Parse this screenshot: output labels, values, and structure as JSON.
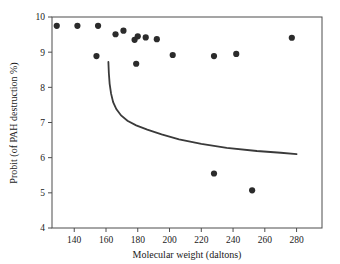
{
  "chart_data": {
    "type": "scatter",
    "title": "",
    "xlabel": "Molecular weight (daltons)",
    "ylabel": "Probit (of PAH destruction %)",
    "xlim": [
      126,
      296
    ],
    "ylim": [
      4,
      10
    ],
    "xticks": [
      140,
      160,
      180,
      200,
      220,
      240,
      260,
      280
    ],
    "yticks": [
      4,
      5,
      6,
      7,
      8,
      9,
      10
    ],
    "grid": false,
    "legend": null,
    "series": [
      {
        "name": "PAH destruction observations",
        "type": "scatter",
        "marker": "filled-circle",
        "color": "#2b2b2b",
        "points": [
          {
            "x": 129,
            "y": 9.75
          },
          {
            "x": 142,
            "y": 9.75
          },
          {
            "x": 155,
            "y": 9.75
          },
          {
            "x": 154,
            "y": 8.89
          },
          {
            "x": 166,
            "y": 9.51
          },
          {
            "x": 171,
            "y": 9.61
          },
          {
            "x": 178,
            "y": 9.35
          },
          {
            "x": 180,
            "y": 9.45
          },
          {
            "x": 179,
            "y": 8.67
          },
          {
            "x": 185,
            "y": 9.42
          },
          {
            "x": 192,
            "y": 9.37
          },
          {
            "x": 202,
            "y": 8.92
          },
          {
            "x": 228,
            "y": 8.89
          },
          {
            "x": 228,
            "y": 5.55
          },
          {
            "x": 242,
            "y": 8.95
          },
          {
            "x": 252,
            "y": 5.07
          },
          {
            "x": 277,
            "y": 9.41
          }
        ]
      },
      {
        "name": "fitted curve",
        "type": "line",
        "color": "#3a3a3a",
        "points": [
          {
            "x": 161.5,
            "y": 8.72
          },
          {
            "x": 161.8,
            "y": 8.4
          },
          {
            "x": 162.3,
            "y": 8.1
          },
          {
            "x": 163.2,
            "y": 7.82
          },
          {
            "x": 164.5,
            "y": 7.58
          },
          {
            "x": 166.5,
            "y": 7.38
          },
          {
            "x": 169.5,
            "y": 7.2
          },
          {
            "x": 173.5,
            "y": 7.05
          },
          {
            "x": 179.0,
            "y": 6.92
          },
          {
            "x": 186.0,
            "y": 6.8
          },
          {
            "x": 195.0,
            "y": 6.66
          },
          {
            "x": 206.0,
            "y": 6.52
          },
          {
            "x": 220.0,
            "y": 6.39
          },
          {
            "x": 236.0,
            "y": 6.28
          },
          {
            "x": 255.0,
            "y": 6.19
          },
          {
            "x": 270.0,
            "y": 6.14
          },
          {
            "x": 280.0,
            "y": 6.1
          }
        ]
      }
    ]
  },
  "axes": {
    "x_tick_labels": [
      "140",
      "160",
      "180",
      "200",
      "220",
      "240",
      "260",
      "280"
    ],
    "y_tick_labels": [
      "4",
      "5",
      "6",
      "7",
      "8",
      "9",
      "10"
    ],
    "x_axis_title": "Molecular weight (daltons)",
    "y_axis_title": "Probit (of PAH destruction %)"
  },
  "colors": {
    "marker": "#2b2b2b",
    "curve": "#3a3a3a",
    "frame": "#4d4d4d",
    "background": "#ffffff",
    "text": "#1a1a1a"
  }
}
